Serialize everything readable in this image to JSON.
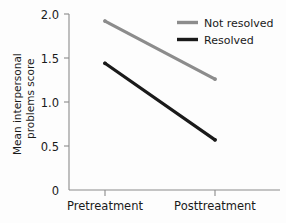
{
  "chart_data": {
    "type": "line",
    "title": "",
    "xlabel": "",
    "ylabel": "Mean interpersonal problems score",
    "ylabel_line1": "Mean interpersonal",
    "ylabel_line2": "problems score",
    "categories": [
      "Pretreatment",
      "Posttreatment"
    ],
    "ylim": [
      0,
      2.0
    ],
    "yticks": [
      0,
      0.5,
      1.0,
      1.5,
      2.0
    ],
    "ytick_labels": [
      "0",
      "0.5",
      "1.0",
      "1.5",
      "2.0"
    ],
    "grid": false,
    "legend_position": "top-right",
    "series": [
      {
        "name": "Not resolved",
        "values": [
          1.92,
          1.26
        ],
        "color": "#8c8c8c"
      },
      {
        "name": "Resolved",
        "values": [
          1.44,
          0.57
        ],
        "color": "#1a1a1a"
      }
    ]
  },
  "legend": {
    "items": [
      {
        "label": "Not resolved",
        "color": "#8c8c8c"
      },
      {
        "label": "Resolved",
        "color": "#1a1a1a"
      }
    ]
  },
  "axes": {
    "y_tick_0": "0",
    "y_tick_1": "0.5",
    "y_tick_2": "1.0",
    "y_tick_3": "1.5",
    "y_tick_4": "2.0",
    "x_tick_0": "Pretreatment",
    "x_tick_1": "Posttreatment",
    "y_title_line1": "Mean interpersonal",
    "y_title_line2": "problems score"
  }
}
